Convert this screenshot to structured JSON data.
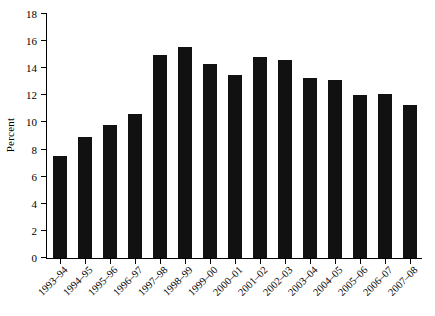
{
  "chart_data": {
    "type": "bar",
    "title": "",
    "subtitle": "",
    "xlabel": "",
    "ylabel": "Percent",
    "ylim": [
      0,
      18
    ],
    "ytick_step": 2,
    "yticks": [
      0,
      2,
      4,
      6,
      8,
      10,
      12,
      14,
      16,
      18
    ],
    "grid": false,
    "legend": null,
    "legend_position": "none",
    "bar_color": "#111111",
    "axis_color": "#000000",
    "background_color": "#ffffff",
    "categories": [
      "1993–94",
      "1994–95",
      "1995–96",
      "1996–97",
      "1997–98",
      "1998–99",
      "1999–00",
      "2000–01",
      "2001–02",
      "2002–03",
      "2003–04",
      "2004–05",
      "2005–06",
      "2006–07",
      "2007–08"
    ],
    "values": [
      7.5,
      8.9,
      9.8,
      10.6,
      15.0,
      15.6,
      14.3,
      13.5,
      14.8,
      14.6,
      13.3,
      13.1,
      12.0,
      12.1,
      11.3
    ],
    "annotations": []
  }
}
